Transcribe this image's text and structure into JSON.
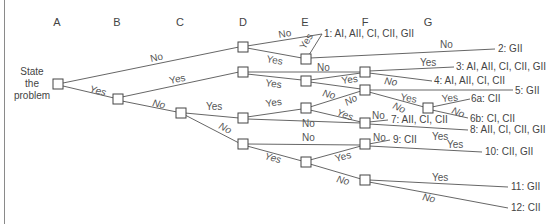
{
  "columns": [
    "A",
    "B",
    "C",
    "D",
    "E",
    "F",
    "G"
  ],
  "start_label": [
    "State",
    "the",
    "problem"
  ],
  "edge_labels": {
    "yes": "Yes",
    "no": "No"
  },
  "outcomes": [
    {
      "id": "1",
      "text": "1: AI, AII, CI, CII, GII"
    },
    {
      "id": "2",
      "text": "2: GII"
    },
    {
      "id": "3",
      "text": "3: AI, AII, CI, CII, GII"
    },
    {
      "id": "4",
      "text": "4: AI, AII, CI, CII"
    },
    {
      "id": "5",
      "text": "5: GII"
    },
    {
      "id": "6a",
      "text": "6a: CII"
    },
    {
      "id": "6b",
      "text": "6b: CI, CII"
    },
    {
      "id": "7",
      "text": "7: AII, CI, CII"
    },
    {
      "id": "8",
      "text": "8: AII, CI, CII, GII"
    },
    {
      "id": "9",
      "text": "9: CII"
    },
    {
      "id": "10",
      "text": "10: CII, GII"
    },
    {
      "id": "11",
      "text": "11: GII"
    },
    {
      "id": "12",
      "text": "12: CII"
    }
  ]
}
